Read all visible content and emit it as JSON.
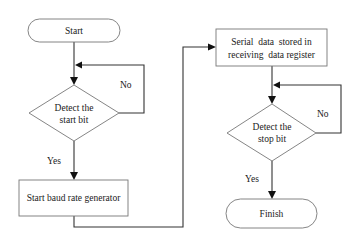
{
  "diagram": {
    "type": "flowchart",
    "nodes": [
      {
        "id": "start",
        "shape": "terminal",
        "label": [
          "Start"
        ]
      },
      {
        "id": "detect_start",
        "shape": "decision",
        "label": [
          "Detect the",
          "start bit"
        ]
      },
      {
        "id": "baud",
        "shape": "process",
        "label": [
          "Start baud rate generator"
        ]
      },
      {
        "id": "store",
        "shape": "process",
        "label": [
          "Serial  data  stored in",
          "receiving  data register"
        ]
      },
      {
        "id": "detect_stop",
        "shape": "decision",
        "label": [
          "Detect the",
          "stop bit"
        ]
      },
      {
        "id": "finish",
        "shape": "terminal",
        "label": [
          "Finish"
        ]
      }
    ],
    "edges": [
      {
        "from": "start",
        "to": "detect_start",
        "label": ""
      },
      {
        "from": "detect_start",
        "to": "detect_start",
        "label": "No"
      },
      {
        "from": "detect_start",
        "to": "baud",
        "label": "Yes"
      },
      {
        "from": "baud",
        "to": "store",
        "label": ""
      },
      {
        "from": "store",
        "to": "detect_stop",
        "label": ""
      },
      {
        "from": "detect_stop",
        "to": "detect_stop",
        "label": "No"
      },
      {
        "from": "detect_stop",
        "to": "finish",
        "label": "Yes"
      }
    ],
    "colors": {
      "shape_stroke": "#777777",
      "edge_stroke": "#333333",
      "text": "#1a1a1a",
      "background": "#ffffff"
    }
  }
}
